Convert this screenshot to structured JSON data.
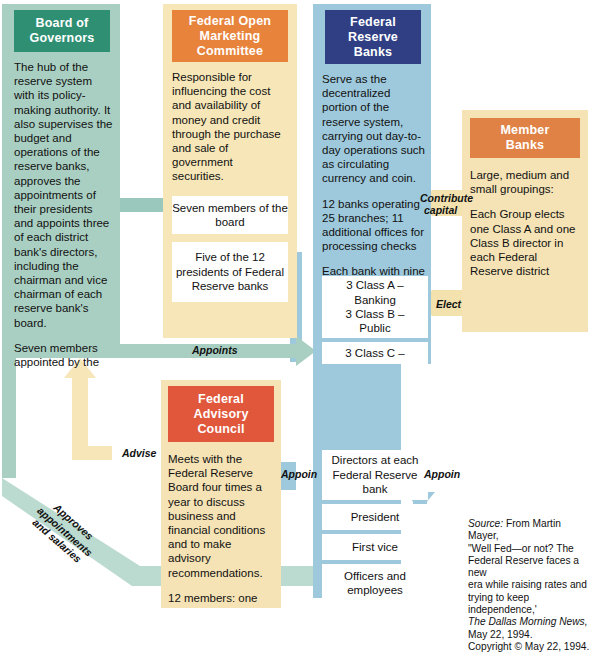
{
  "diagram": {
    "colors": {
      "board_header": "#2f8f73",
      "board_panel": "#a9cfc2",
      "fomc_header": "#e8833c",
      "fomc_panel": "#f7e7b8",
      "frb_header": "#303f84",
      "frb_panel": "#9ec9dc",
      "member_header": "#e08245",
      "member_panel": "#f5e3b5",
      "fac_header": "#e1573b",
      "fac_panel": "#f5e3b5",
      "white_box": "#ffffff"
    }
  },
  "board_of_governors": {
    "header": "Board of\nGovernors",
    "header_line1": "Board of",
    "header_line2": "Governors",
    "paragraph1": "The hub of the reserve system with its policy-making authority. It also supervises the budget and operations of the reserve banks, approves the appointments of their presidents and appoints three of each district bank's directors, including the chairman and vice chairman of each reserve bank's board.",
    "paragraph2": "Seven members appointed by the"
  },
  "fomc": {
    "header_line1": "Federal Open",
    "header_line2": "Marketing",
    "header_line3": "Committee",
    "paragraph1": "Responsible for influencing the cost and availability of money and credit through the purchase and sale of government securities.",
    "boxes": [
      "Seven members of the board",
      "Five of the 12 presidents of Federal Reserve banks"
    ]
  },
  "federal_reserve_banks": {
    "header_line1": "Federal",
    "header_line2": "Reserve",
    "header_line3": "Banks",
    "paragraph1": "Serve as the decentralized portion of the reserve system, carrying out day-to-day operations such as circulating currency and coin.",
    "paragraph2": "12 banks operating 25 branches; 11 additional offices for processing checks",
    "paragraph3": "Each bank with nine",
    "class_box_lines": [
      "3 Class A –",
      "Banking",
      "3 Class B –",
      "Public"
    ],
    "class_c_box": "3 Class C –",
    "org_boxes": [
      "Directors at each Federal Reserve bank",
      "President",
      "First vice",
      "Officers and employees"
    ]
  },
  "member_banks": {
    "header_line1": "Member",
    "header_line2": "Banks",
    "paragraph1": "Large, medium and small groupings:",
    "paragraph2": "Each Group elects one Class A and one Class B director in each Federal Reserve district"
  },
  "federal_advisory_council": {
    "header_line1": "Federal",
    "header_line2": "Advisory",
    "header_line3": "Council",
    "paragraph1": "Meets with the Federal Reserve Board four times a year to discuss business and financial conditions and to make advisory recommendations.",
    "paragraph2": "12 members: one"
  },
  "arrow_labels": {
    "appoints": "Appoints",
    "contribute_capital_line1": "Contribute",
    "contribute_capital_line2": "capital",
    "elect": "Elect",
    "advise": "Advise",
    "appoin_center": "Appoin",
    "appoin_right": "Appoin",
    "approves_diagonal_line1": "Approves appointments",
    "approves_diagonal_line2": "and salaries"
  },
  "source_note": {
    "label": "Source:",
    "line1": " From Martin Mayer,",
    "line2": "\"Well Fed—or not? The",
    "line3": "Federal Reserve faces a new",
    "line4": "era while raising rates and",
    "line5": "trying to keep independence,'",
    "publication": "The Dallas Morning News,",
    "line6": "May 22, 1994.",
    "line7": "Copyright © May 22, 1994."
  }
}
